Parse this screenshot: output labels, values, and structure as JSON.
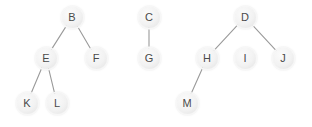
{
  "diagram": {
    "type": "node-link-forest",
    "width": 312,
    "height": 127,
    "background_color": "#ffffff",
    "node_fill_color": "#f1f1f1",
    "node_label_color": "#4a4a4a",
    "edge_color": "#9a9a9a",
    "node_diameter": 21,
    "edge_width": 1.1,
    "nodes": [
      {
        "id": "B",
        "label": "B",
        "x": 72,
        "y": 17
      },
      {
        "id": "E",
        "label": "E",
        "x": 46,
        "y": 58
      },
      {
        "id": "F",
        "label": "F",
        "x": 96,
        "y": 58
      },
      {
        "id": "K",
        "label": "K",
        "x": 27,
        "y": 103
      },
      {
        "id": "L",
        "label": "L",
        "x": 57,
        "y": 103
      },
      {
        "id": "C",
        "label": "C",
        "x": 149,
        "y": 17
      },
      {
        "id": "G",
        "label": "G",
        "x": 149,
        "y": 58
      },
      {
        "id": "D",
        "label": "D",
        "x": 245,
        "y": 17
      },
      {
        "id": "H",
        "label": "H",
        "x": 207,
        "y": 58
      },
      {
        "id": "I",
        "label": "I",
        "x": 245,
        "y": 58
      },
      {
        "id": "J",
        "label": "J",
        "x": 283,
        "y": 58
      },
      {
        "id": "M",
        "label": "M",
        "x": 187,
        "y": 103
      }
    ],
    "edges": [
      {
        "from": "B",
        "to": "E"
      },
      {
        "from": "B",
        "to": "F"
      },
      {
        "from": "E",
        "to": "K"
      },
      {
        "from": "E",
        "to": "L"
      },
      {
        "from": "C",
        "to": "G"
      },
      {
        "from": "D",
        "to": "H"
      },
      {
        "from": "D",
        "to": "J"
      },
      {
        "from": "H",
        "to": "M"
      }
    ],
    "components": [
      {
        "root": "B",
        "members": [
          "B",
          "E",
          "F",
          "K",
          "L"
        ]
      },
      {
        "root": "C",
        "members": [
          "C",
          "G"
        ]
      },
      {
        "root": "D",
        "members": [
          "D",
          "H",
          "J",
          "M"
        ]
      },
      {
        "root": "I",
        "members": [
          "I"
        ]
      }
    ]
  }
}
